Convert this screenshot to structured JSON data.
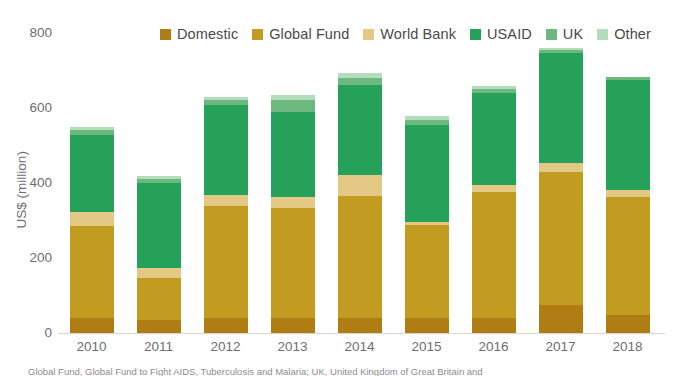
{
  "chart_data": {
    "type": "bar",
    "stacked": true,
    "title": "",
    "xlabel": "",
    "ylabel": "US$ (million)",
    "ylim": [
      0,
      800
    ],
    "yticks": [
      0,
      200,
      400,
      600,
      800
    ],
    "grid": false,
    "legend_position": "top",
    "categories": [
      "2010",
      "2011",
      "2012",
      "2013",
      "2014",
      "2015",
      "2016",
      "2017",
      "2018"
    ],
    "series": [
      {
        "name": "Domestic",
        "color": "#b07d14",
        "values": [
          40,
          35,
          40,
          40,
          40,
          40,
          40,
          75,
          48
        ]
      },
      {
        "name": "Global Fund",
        "color": "#c29b21",
        "values": [
          245,
          112,
          300,
          293,
          325,
          248,
          336,
          355,
          315
        ]
      },
      {
        "name": "World Bank",
        "color": "#e3c886",
        "values": [
          37,
          27,
          27,
          29,
          56,
          8,
          19,
          24,
          19
        ]
      },
      {
        "name": "USAID",
        "color": "#25a159",
        "values": [
          205,
          227,
          240,
          227,
          240,
          260,
          245,
          293,
          293
        ]
      },
      {
        "name": "UK",
        "color": "#6cb87f",
        "values": [
          15,
          10,
          15,
          32,
          20,
          12,
          10,
          8,
          8
        ]
      },
      {
        "name": "Other",
        "color": "#b3dcbd",
        "values": [
          8,
          8,
          8,
          15,
          12,
          10,
          8,
          5,
          0
        ]
      }
    ],
    "totals": [
      550,
      419,
      630,
      636,
      693,
      578,
      658,
      760,
      683
    ]
  },
  "legend": {
    "items": [
      {
        "label": "Domestic",
        "icon": "legend-swatch-icon"
      },
      {
        "label": "Global Fund",
        "icon": "legend-swatch-icon"
      },
      {
        "label": "World Bank",
        "icon": "legend-swatch-icon"
      },
      {
        "label": "USAID",
        "icon": "legend-swatch-icon"
      },
      {
        "label": "UK",
        "icon": "legend-swatch-icon"
      },
      {
        "label": "Other",
        "icon": "legend-swatch-icon"
      }
    ]
  },
  "footnote": {
    "text": "Global Fund, Global Fund to Fight AIDS, Tuberculosis and Malaria; UK, United Kingdom of Great Britain and"
  }
}
